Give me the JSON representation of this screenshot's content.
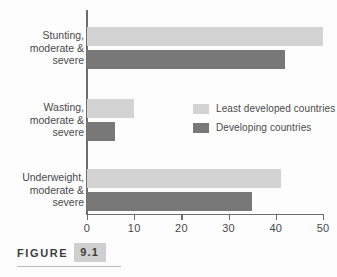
{
  "figure": {
    "caption_word": "FIGURE",
    "caption_number": "9.1"
  },
  "legend": {
    "position": "center-right",
    "entries": [
      {
        "label": "Least developed countries",
        "color": "#d3d3d3"
      },
      {
        "label": "Developing countries",
        "color": "#787878"
      }
    ]
  },
  "axis": {
    "tick_labels": [
      "0",
      "10",
      "20",
      "30",
      "40",
      "50"
    ]
  },
  "categories_display": [
    [
      "Stunting,",
      "moderate &",
      "severe"
    ],
    [
      "Wasting,",
      "moderate &",
      "severe"
    ],
    [
      "Underweight,",
      "moderate &",
      "severe"
    ]
  ],
  "chart_data": {
    "type": "bar",
    "orientation": "horizontal",
    "title": "",
    "subtitle": "",
    "xlabel": "",
    "ylabel": "",
    "xlim": [
      0,
      50
    ],
    "xticks": [
      0,
      10,
      20,
      30,
      40,
      50
    ],
    "grid": false,
    "legend_position": "center-right",
    "categories": [
      "Stunting, moderate & severe",
      "Wasting, moderate & severe",
      "Underweight, moderate & severe"
    ],
    "series": [
      {
        "name": "Least developed countries",
        "color": "#d3d3d3",
        "values": [
          50,
          10,
          41
        ]
      },
      {
        "name": "Developing countries",
        "color": "#787878",
        "values": [
          42,
          6,
          35
        ]
      }
    ]
  }
}
